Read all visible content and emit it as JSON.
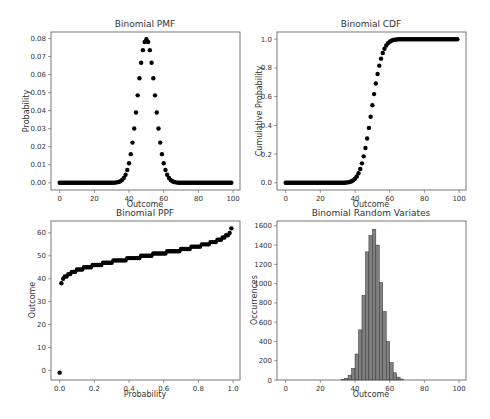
{
  "figure": {
    "width": 490,
    "height": 419,
    "background": "#ffffff"
  },
  "colors": {
    "marker": "#000000",
    "bar_fill": "#808080",
    "bar_edge": "#333333",
    "axis": "#555555",
    "text": "#333333"
  },
  "chart_data": [
    {
      "id": "pmf",
      "type": "scatter",
      "title": "Binomial PMF",
      "xlabel": "Outcome",
      "ylabel": "Probability",
      "distribution": {
        "n": 100,
        "p": 0.5
      },
      "x": [
        0,
        1,
        2,
        3,
        4,
        5,
        6,
        7,
        8,
        9,
        10,
        11,
        12,
        13,
        14,
        15,
        16,
        17,
        18,
        19,
        20,
        21,
        22,
        23,
        24,
        25,
        26,
        27,
        28,
        29,
        30,
        31,
        32,
        33,
        34,
        35,
        36,
        37,
        38,
        39,
        40,
        41,
        42,
        43,
        44,
        45,
        46,
        47,
        48,
        49,
        50,
        51,
        52,
        53,
        54,
        55,
        56,
        57,
        58,
        59,
        60,
        61,
        62,
        63,
        64,
        65,
        66,
        67,
        68,
        69,
        70,
        71,
        72,
        73,
        74,
        75,
        76,
        77,
        78,
        79,
        80,
        81,
        82,
        83,
        84,
        85,
        86,
        87,
        88,
        89,
        90,
        91,
        92,
        93,
        94,
        95,
        96,
        97,
        98,
        99
      ],
      "values_note": "y = binomial pmf(x; n=100, p=0.5); peak 0.0796 at x=50; 0.0108 at x=40/60",
      "xlim": [
        -5,
        104
      ],
      "ylim": [
        -0.004,
        0.0836
      ],
      "xticks": [
        0,
        20,
        40,
        60,
        80,
        100
      ],
      "xtick_labels": [
        "0",
        "20",
        "40",
        "60",
        "80",
        "100"
      ],
      "yticks": [
        0,
        0.01,
        0.02,
        0.03,
        0.04,
        0.05,
        0.06,
        0.07,
        0.08
      ],
      "ytick_labels": [
        "0.00",
        "0.01",
        "0.02",
        "0.03",
        "0.04",
        "0.05",
        "0.06",
        "0.07",
        "0.08"
      ],
      "grid": false
    },
    {
      "id": "cdf",
      "type": "scatter",
      "title": "Binomial CDF",
      "xlabel": "Outcome",
      "ylabel": "Cumulative Probability",
      "distribution": {
        "n": 100,
        "p": 0.5
      },
      "values_note": "y = binomial cdf(x; n=100, p=0.5) for x=0..99; ~0.54 at x=50, ~0.98 at x=60",
      "xlim": [
        -5,
        104
      ],
      "ylim": [
        -0.05,
        1.05
      ],
      "xticks": [
        0,
        20,
        40,
        60,
        80,
        100
      ],
      "xtick_labels": [
        "0",
        "20",
        "40",
        "60",
        "80",
        "100"
      ],
      "yticks": [
        0,
        0.2,
        0.4,
        0.6,
        0.8,
        1.0
      ],
      "ytick_labels": [
        "0.0",
        "0.2",
        "0.4",
        "0.6",
        "0.8",
        "1.0"
      ],
      "grid": false
    },
    {
      "id": "ppf",
      "type": "scatter",
      "title": "Binomial PPF",
      "xlabel": "Probability",
      "ylabel": "Outcome",
      "distribution": {
        "n": 100,
        "p": 0.5
      },
      "x_range": {
        "start": 0,
        "stop": 1,
        "step": 0.01
      },
      "values_note": "y = binomial ppf(q) for q=0.00..0.99; ppf(0) = -1, ppf(0.01)=38, ppf(0.5)=50, ppf(0.99)=62",
      "xlim": [
        -0.05,
        1.04
      ],
      "ylim": [
        -4.2,
        65.2
      ],
      "xticks": [
        0,
        0.2,
        0.4,
        0.6,
        0.8,
        1.0
      ],
      "xtick_labels": [
        "0.0",
        "0.2",
        "0.4",
        "0.6",
        "0.8",
        "1.0"
      ],
      "yticks": [
        0,
        10,
        20,
        30,
        40,
        50,
        60
      ],
      "ytick_labels": [
        "0",
        "10",
        "20",
        "30",
        "40",
        "50",
        "60"
      ],
      "grid": false
    },
    {
      "id": "rvs",
      "type": "bar",
      "title": "Binomial Random Variates",
      "xlabel": "Outcome",
      "ylabel": "Occurrences",
      "bin_edges": [
        32,
        34,
        36,
        38,
        40,
        42,
        44,
        46,
        48,
        50,
        52,
        54,
        56,
        58,
        60,
        62,
        64,
        66,
        68
      ],
      "values": [
        5,
        18,
        50,
        120,
        270,
        520,
        880,
        1330,
        1500,
        1565,
        1400,
        1010,
        710,
        400,
        180,
        75,
        30,
        10
      ],
      "xlim": [
        -5,
        104
      ],
      "ylim": [
        0,
        1650
      ],
      "xticks": [
        0,
        20,
        40,
        60,
        80,
        100
      ],
      "xtick_labels": [
        "0",
        "20",
        "40",
        "60",
        "80",
        "100"
      ],
      "yticks": [
        0,
        200,
        400,
        600,
        800,
        1000,
        1200,
        1400,
        1600
      ],
      "ytick_labels": [
        "0",
        "200",
        "400",
        "600",
        "800",
        "1000",
        "1200",
        "1400",
        "1600"
      ],
      "grid": false
    }
  ],
  "panels": {
    "pmf": {
      "left": 51,
      "top": 32,
      "right": 240,
      "bottom": 190
    },
    "cdf": {
      "left": 277,
      "top": 32,
      "right": 466,
      "bottom": 190
    },
    "ppf": {
      "left": 51,
      "top": 221,
      "right": 240,
      "bottom": 380
    },
    "rvs": {
      "left": 277,
      "top": 221,
      "right": 466,
      "bottom": 380
    }
  }
}
